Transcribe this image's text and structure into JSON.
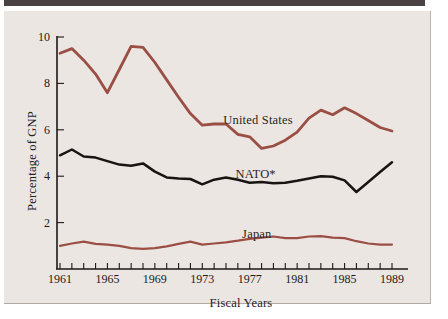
{
  "figure": {
    "page_bg": "#ffffff",
    "top_bar_color": "#4a4242",
    "panel_bg": "#ebe6e2"
  },
  "chart_data": {
    "type": "line",
    "title": "",
    "xlabel": "Fiscal Years",
    "ylabel": "Percentage of GNP",
    "x": [
      1961,
      1962,
      1963,
      1964,
      1965,
      1966,
      1967,
      1968,
      1969,
      1970,
      1971,
      1972,
      1973,
      1974,
      1975,
      1976,
      1977,
      1978,
      1979,
      1980,
      1981,
      1982,
      1983,
      1984,
      1985,
      1986,
      1987,
      1988,
      1989
    ],
    "xlim": [
      1961,
      1989
    ],
    "ylim": [
      0,
      10
    ],
    "yticks": [
      2,
      4,
      6,
      8,
      10
    ],
    "xtick_labels": [
      1961,
      1965,
      1969,
      1973,
      1977,
      1981,
      1985,
      1989
    ],
    "grid": false,
    "legend": "inline-annotations",
    "axis_color": "#1c1917",
    "series": [
      {
        "id": "united-states",
        "name": "United States",
        "color": "#9a4e44",
        "stroke_width": 2.8,
        "values": [
          9.3,
          9.5,
          9.0,
          8.4,
          7.6,
          8.6,
          9.6,
          9.55,
          8.9,
          8.15,
          7.4,
          6.7,
          6.2,
          6.25,
          6.25,
          5.8,
          5.7,
          5.2,
          5.3,
          5.55,
          5.9,
          6.5,
          6.85,
          6.65,
          6.95,
          6.7,
          6.4,
          6.1,
          5.95
        ]
      },
      {
        "id": "nato",
        "name": "NATO*",
        "color": "#171412",
        "stroke_width": 2.5,
        "values": [
          4.9,
          5.15,
          4.85,
          4.8,
          4.65,
          4.5,
          4.45,
          4.55,
          4.2,
          3.95,
          3.9,
          3.88,
          3.65,
          3.85,
          3.95,
          3.85,
          3.72,
          3.75,
          3.7,
          3.72,
          3.8,
          3.9,
          4.0,
          3.98,
          3.82,
          3.32,
          3.75,
          4.18,
          4.6
        ]
      },
      {
        "id": "japan",
        "name": "Japan",
        "color": "#9a4e44",
        "stroke_width": 2.2,
        "values": [
          1.0,
          1.1,
          1.18,
          1.08,
          1.05,
          1.0,
          0.9,
          0.87,
          0.9,
          0.98,
          1.08,
          1.18,
          1.05,
          1.1,
          1.15,
          1.22,
          1.3,
          1.35,
          1.4,
          1.33,
          1.33,
          1.4,
          1.42,
          1.35,
          1.33,
          1.2,
          1.1,
          1.05,
          1.05
        ]
      }
    ],
    "annotations": [
      {
        "id": "united-states",
        "text": "United States",
        "x": 1977.7,
        "y": 6.42
      },
      {
        "id": "nato",
        "text": "NATO*",
        "x": 1977.5,
        "y": 4.09
      },
      {
        "id": "japan",
        "text": "Japan",
        "x": 1977.6,
        "y": 1.51
      }
    ]
  }
}
